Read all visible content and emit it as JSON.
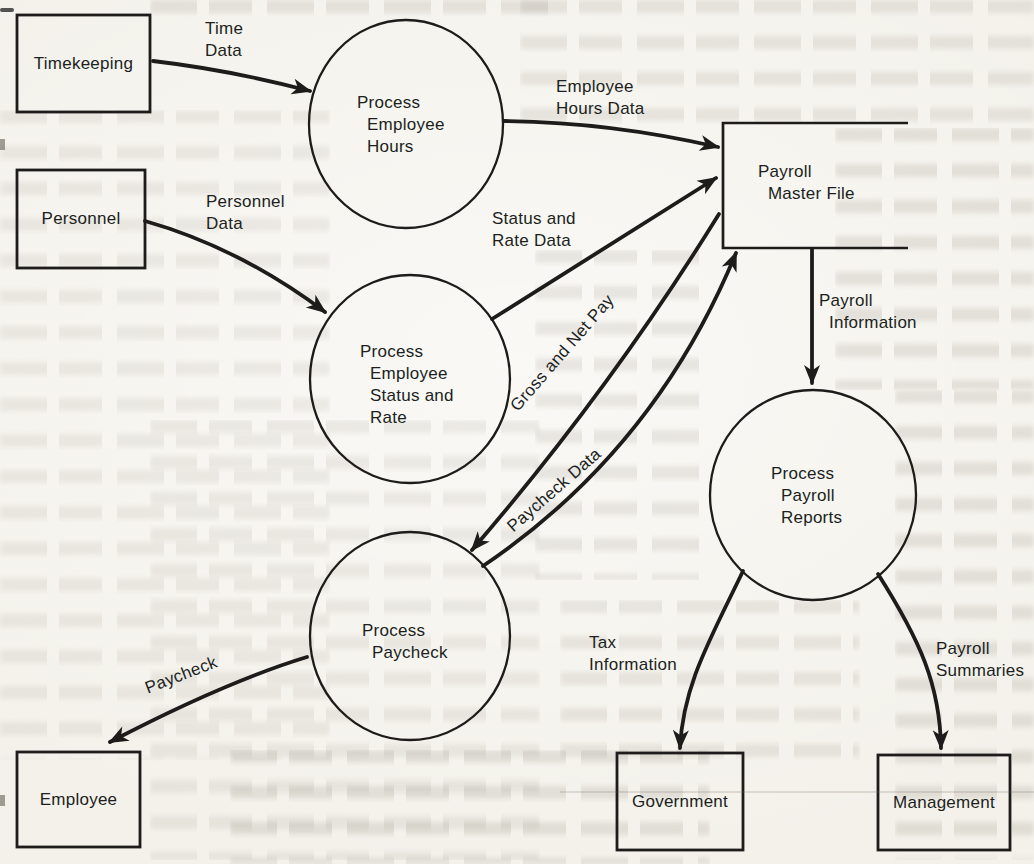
{
  "page": {
    "kind": "scanned textbook figure",
    "colors": {
      "ink": "#1d1c1a",
      "paper": "#f3f1ea"
    }
  },
  "diagram": {
    "type": "data-flow-diagram",
    "external_entities": [
      "Timekeeping",
      "Personnel",
      "Employee",
      "Government",
      "Management"
    ],
    "processes": [
      "Process Employee Hours",
      "Process Employee Status and Rate",
      "Process Paycheck",
      "Process Payroll Reports"
    ],
    "data_stores": [
      "Payroll Master File"
    ],
    "flows": [
      {
        "from": "Timekeeping",
        "to": "Process Employee Hours",
        "label": "Time Data"
      },
      {
        "from": "Personnel",
        "to": "Process Employee Status and Rate",
        "label": "Personnel Data"
      },
      {
        "from": "Process Employee Hours",
        "to": "Payroll Master File",
        "label": "Employee Hours Data"
      },
      {
        "from": "Process Employee Status and Rate",
        "to": "Payroll Master File",
        "label": "Status and Rate Data"
      },
      {
        "from": "Process Paycheck",
        "to": "Payroll Master File",
        "label": "Gross and Net Pay"
      },
      {
        "from": "Payroll Master File",
        "to": "Process Paycheck",
        "label": "Paycheck Data"
      },
      {
        "from": "Payroll Master File",
        "to": "Process Payroll Reports",
        "label": "Payroll Information"
      },
      {
        "from": "Process Paycheck",
        "to": "Employee",
        "label": "Paycheck"
      },
      {
        "from": "Process Payroll Reports",
        "to": "Government",
        "label": "Tax Information"
      },
      {
        "from": "Process Payroll Reports",
        "to": "Management",
        "label": "Payroll Summaries"
      }
    ]
  },
  "labels": {
    "timekeeping": "Timekeeping",
    "personnel": "Personnel",
    "employee": "Employee",
    "government": "Government",
    "management": "Management",
    "payroll_master_file": "Payroll\n  Master File",
    "process_employee_hours": "Process\n  Employee\n  Hours",
    "process_employee_status_rate": "Process\n  Employee\n  Status and\n  Rate",
    "process_paycheck": "Process\n  Paycheck",
    "process_payroll_reports": "Process\n  Payroll\n  Reports",
    "time_data": "Time\nData",
    "personnel_data": "Personnel\nData",
    "employee_hours_data": "Employee\nHours Data",
    "status_rate_data": "Status and\nRate Data",
    "gross_net_pay": "Gross and Net Pay",
    "paycheck_data": "Paycheck Data",
    "payroll_information": "Payroll\n  Information",
    "tax_information": "Tax\nInformation",
    "payroll_summaries": "Payroll\nSummaries",
    "paycheck": "Paycheck"
  }
}
